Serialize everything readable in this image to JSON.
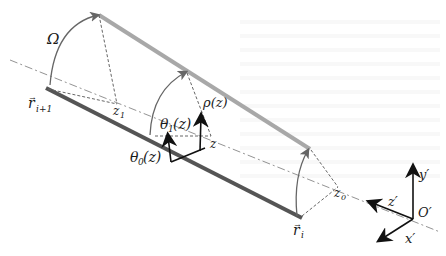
{
  "diagram": {
    "labels": {
      "omega": "Ω",
      "r_next": "r",
      "r_next_sub": "i+1",
      "r_i": "r",
      "r_i_sub": "i",
      "z1": "z",
      "z1_sub": "1",
      "z0": "z",
      "z0_sub": "0",
      "z": "z",
      "rho": "ρ(z)",
      "theta1": "θ",
      "theta1_sub": "1",
      "theta1_arg": "(z)",
      "theta0": "θ",
      "theta0_sub": "0",
      "theta0_arg": "(z)",
      "origin": "O′",
      "x_axis": "x′",
      "y_axis": "y′",
      "z_axis": "z′"
    },
    "colors": {
      "dark_edge": "#555555",
      "light_edge": "#a8a8a8",
      "arc": "#666666",
      "dashed": "#666666",
      "axis": "#111111"
    }
  }
}
